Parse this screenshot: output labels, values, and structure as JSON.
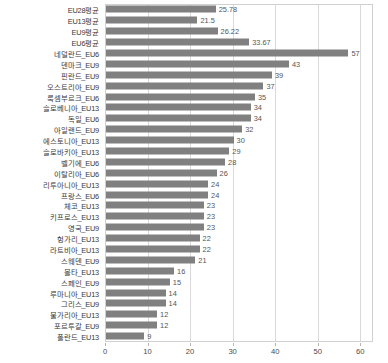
{
  "chart_data": {
    "type": "bar",
    "orientation": "horizontal",
    "title": "",
    "xlabel": "",
    "ylabel": "",
    "xlim": [
      0,
      63
    ],
    "xticks": [
      0,
      10,
      20,
      30,
      40,
      50,
      60
    ],
    "xtick_labels": [
      "0",
      "10",
      "20",
      "30",
      "40",
      "50",
      "60"
    ],
    "grid": "vertical",
    "legend": "none",
    "bar_color": "#808080",
    "categories": [
      "EU28평균",
      "EU13평균",
      "EU9평균",
      "EU6평균",
      "네덜란드_EU6",
      "덴마크_EU9",
      "핀란드_EU9",
      "오스트리아_EU9",
      "룩셈부르크_EU6",
      "슬로베니아_EU13",
      "독일_EU6",
      "아일랜드_EU9",
      "에스토니아_EU13",
      "슬로바키아_EU13",
      "벨기에_EU6",
      "이탈리아_EU6",
      "리투아니아_EU13",
      "프랑스_EU6",
      "체코_EU13",
      "키프로스_EU13",
      "영국_EU9",
      "헝가리_EU13",
      "라트비아_EU13",
      "스웨덴_EU9",
      "몰타_EU13",
      "스페인_EU9",
      "루마니아_EU13",
      "그리스_EU9",
      "불가리아_EU13",
      "포르투갈_EU9",
      "폴란드_EU13"
    ],
    "values": [
      25.78,
      21.5,
      26.22,
      33.67,
      57,
      43,
      39,
      37,
      35,
      34,
      34,
      32,
      30,
      29,
      28,
      26,
      24,
      24,
      23,
      23,
      23,
      22,
      22,
      21,
      16,
      15,
      14,
      14,
      12,
      12,
      9
    ],
    "value_labels": [
      "25.78",
      "21.5",
      "26.22",
      "33.67",
      "57",
      "43",
      "39",
      "37",
      "35",
      "34",
      "34",
      "32",
      "30",
      "29",
      "28",
      "26",
      "24",
      "24",
      "23",
      "23",
      "23",
      "22",
      "22",
      "21",
      "16",
      "15",
      "14",
      "14",
      "12",
      "12",
      "9"
    ]
  }
}
